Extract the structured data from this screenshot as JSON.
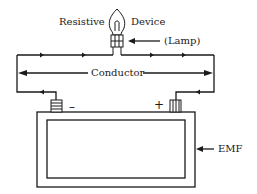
{
  "diagram": {
    "labels": {
      "resistive": "Resistive",
      "device": "Device",
      "lamp": "(Lamp)",
      "conductor": "Conductor",
      "negative": "–",
      "positive": "+",
      "emf": "EMF"
    },
    "components": [
      "lamp",
      "conductor",
      "battery"
    ],
    "colors": {
      "line": "#1a1a1a",
      "background": "#ffffff"
    }
  }
}
